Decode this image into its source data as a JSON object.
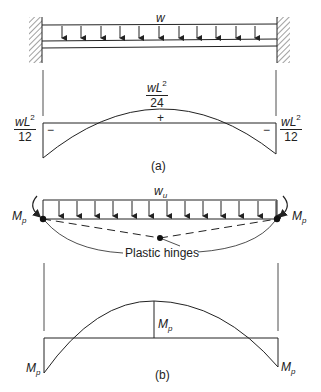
{
  "figure_a": {
    "load_label": "w",
    "moment_diagram": {
      "midspan_label_num": "wL",
      "midspan_label_exp": "2",
      "midspan_label_den": "24",
      "midspan_sign": "+",
      "left_support_label_num": "wL",
      "left_support_label_exp": "2",
      "left_support_label_den": "12",
      "left_sign": "−",
      "right_support_label_num": "wL",
      "right_support_label_exp": "2",
      "right_support_label_den": "12",
      "right_sign": "−"
    },
    "caption": "(a)"
  },
  "figure_b": {
    "load_label_base": "w",
    "load_label_sub": "u",
    "left_moment_label_base": "M",
    "left_moment_label_sub": "p",
    "right_moment_label_base": "M",
    "right_moment_label_sub": "p",
    "hinge_label": "Plastic hinges",
    "moment_diagram": {
      "midspan_label_base": "M",
      "midspan_label_sub": "p",
      "left_label_base": "M",
      "left_label_sub": "p",
      "right_label_base": "M",
      "right_label_sub": "p"
    },
    "caption": "(b)"
  },
  "colors": {
    "line": "#222222",
    "background": "#ffffff"
  }
}
